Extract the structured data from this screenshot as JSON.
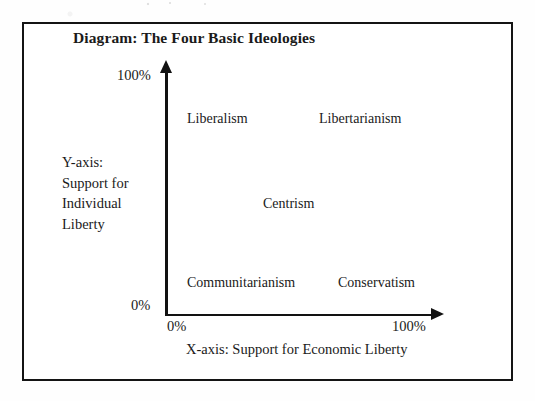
{
  "figure": {
    "title": "Diagram: The Four Basic Ideologies",
    "border_color": "#141414",
    "background_color": "#ffffff"
  },
  "axes": {
    "color": "#121212",
    "y": {
      "caption_lines": [
        "Y-axis:",
        "Support for",
        "Individual",
        "Liberty"
      ],
      "caption": "Y-axis: Support for Individual Liberty",
      "min_label": "0%",
      "max_label": "100%"
    },
    "x": {
      "caption": "X-axis: Support for Economic Liberty",
      "min_label": "0%",
      "max_label": "100%"
    }
  },
  "labels": {
    "liberalism": "Liberalism",
    "libertarianism": "Libertarianism",
    "centrism": "Centrism",
    "communitarianism": "Communitarianism",
    "conservatism": "Conservatism"
  },
  "chart_data": {
    "type": "scatter",
    "title": "Diagram: The Four Basic Ideologies",
    "xlabel": "X-axis: Support for Economic Liberty",
    "ylabel": "Y-axis: Support for Individual Liberty",
    "xlim": [
      0,
      100
    ],
    "ylim": [
      0,
      100
    ],
    "xticks": [
      0,
      100
    ],
    "xticklabels": [
      "0%",
      "100%"
    ],
    "yticks": [
      0,
      100
    ],
    "yticklabels": [
      "0%",
      "100%"
    ],
    "grid": false,
    "legend": "none",
    "annotations": [
      {
        "label": "Liberalism",
        "x": 16,
        "y": 83
      },
      {
        "label": "Libertarianism",
        "x": 65,
        "y": 83
      },
      {
        "label": "Centrism",
        "x": 45,
        "y": 48
      },
      {
        "label": "Communitarianism",
        "x": 16,
        "y": 16
      },
      {
        "label": "Conservatism",
        "x": 70,
        "y": 16
      }
    ]
  }
}
